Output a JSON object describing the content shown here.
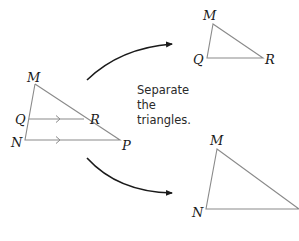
{
  "caption": {
    "lines": [
      "Separate",
      "the",
      "triangles."
    ]
  },
  "colors": {
    "triangle_stroke": "#8a8a8a",
    "arrow_stroke": "#1a1a1a",
    "label": "#1a1a1a",
    "background": "#ffffff"
  },
  "original": {
    "name": "triangle-MNP",
    "labels": {
      "M": "M",
      "Q": "Q",
      "R": "R",
      "N": "N",
      "P": "P"
    },
    "parallel_marks": "QR ∥ NP"
  },
  "top_result": {
    "name": "triangle-MQR",
    "labels": {
      "M": "M",
      "Q": "Q",
      "R": "R"
    }
  },
  "bottom_result": {
    "name": "triangle-MNP",
    "labels": {
      "M": "M",
      "N": "N",
      "P": "P"
    }
  }
}
